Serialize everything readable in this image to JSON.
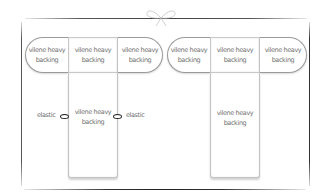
{
  "diagram": {
    "title_ornament": "bow-icon",
    "left_group": {
      "top_row": [
        {
          "label": "vilene heavy\nbacking",
          "shape": "rounded-left"
        },
        {
          "label": "vilene heavy\nbacking",
          "shape": "square"
        },
        {
          "label": "vilene heavy\nbacking",
          "shape": "rounded-right"
        }
      ],
      "strip": {
        "label": "vilene heavy\nbacking"
      },
      "elastic_left": "elastic",
      "elastic_right": "elastic"
    },
    "right_group": {
      "top_row": [
        {
          "label": "vilene heavy\nbacking",
          "shape": "rounded-left"
        },
        {
          "label": "vilene heavy\nbacking",
          "shape": "square"
        },
        {
          "label": "vilene heavy\nbacking",
          "shape": "rounded-right"
        }
      ],
      "strip": {
        "label": "vilene heavy\nbacking"
      }
    }
  }
}
